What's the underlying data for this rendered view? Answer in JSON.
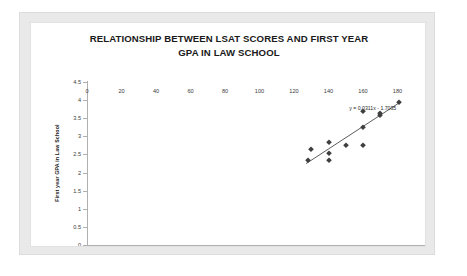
{
  "chart_data": {
    "type": "scatter",
    "title": "RELATIONSHIP BETWEEN LSAT SCORES AND FIRST YEAR GPA IN LAW SCHOOL",
    "title_lines": [
      "RELATIONSHIP BETWEEN LSAT SCORES AND FIRST YEAR",
      "GPA IN LAW SCHOOL"
    ],
    "xlabel": "LSAT Scores",
    "ylabel": "First year GPA in Law School",
    "xlim": [
      0,
      200
    ],
    "ylim": [
      0,
      4.5
    ],
    "xticks": [
      0,
      20,
      40,
      60,
      80,
      100,
      120,
      140,
      160,
      180,
      200
    ],
    "xtick_labels": [
      "0",
      "20",
      "40",
      "60",
      "80",
      "100",
      "120",
      "140",
      "160",
      "180",
      "200"
    ],
    "yticks": [
      0,
      0.5,
      1,
      1.5,
      2,
      2.5,
      3,
      3.5,
      4,
      4.5
    ],
    "ytick_labels": [
      "0",
      "0.5",
      "1",
      "1.5",
      "2",
      "2.5",
      "3",
      "3.5",
      "4",
      "4.5"
    ],
    "grid": false,
    "legend": false,
    "marker": "diamond",
    "marker_color": "#3f3f3f",
    "series": [
      {
        "name": "LSAT vs GPA",
        "x": [
          128,
          130,
          140,
          140,
          140,
          150,
          160,
          160,
          160,
          170,
          170,
          181
        ],
        "y": [
          2.35,
          2.65,
          2.85,
          2.55,
          2.35,
          2.75,
          2.75,
          3.25,
          3.7,
          3.65,
          3.6,
          3.95
        ]
      }
    ],
    "trendline": {
      "equation": "y = 0.0311x - 1.7035",
      "slope": 0.0311,
      "intercept": -1.7035,
      "x_start": 127,
      "x_end": 182,
      "color": "#4a4a4a"
    },
    "annotations": [
      {
        "name": "trendline-equation",
        "text": "y = 0.0311x - 1.7035",
        "x": 152,
        "y": 3.78
      }
    ],
    "colors": {
      "frame": "#e9e9e9",
      "plot_background": "#ffffff",
      "axis": "#b0b0b0",
      "text": "#1a1a1a"
    }
  }
}
